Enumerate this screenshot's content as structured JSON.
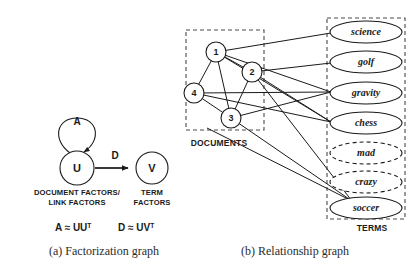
{
  "figure": {
    "background": "#ffffff",
    "stroke_color": "#1a1a1a",
    "box_color": "#4a4a4a"
  },
  "panel_a": {
    "caption": "(a) Factorization graph",
    "nodes": [
      {
        "id": "U",
        "label": "U",
        "cx": 77,
        "cy": 168,
        "r": 17
      },
      {
        "id": "V",
        "label": "V",
        "cx": 152,
        "cy": 168,
        "r": 16
      }
    ],
    "self_loop": {
      "label": "A",
      "label_x": 77,
      "label_y": 121
    },
    "edge": {
      "label": "D",
      "label_x": 115,
      "label_y": 162,
      "from": "U",
      "to": "V"
    },
    "under_labels": [
      {
        "lines": [
          "DOCUMENT FACTORS/",
          "LINK FACTORS"
        ],
        "x": 77,
        "y": 192
      },
      {
        "lines": [
          "TERM",
          "FACTORS"
        ],
        "x": 152,
        "y": 192
      }
    ],
    "formulas": [
      {
        "base": "A ≈ UU",
        "sup": "T",
        "x": 55,
        "y": 228
      },
      {
        "base": "D ≈ UV",
        "sup": "T",
        "x": 118,
        "y": 228
      }
    ]
  },
  "panel_b": {
    "caption": "(b) Relationship graph",
    "documents_group": {
      "label": "DOCUMENTS",
      "label_x": 219,
      "label_y": 143,
      "box": {
        "x": 186,
        "y": 30,
        "width": 78,
        "height": 100
      }
    },
    "terms_group": {
      "label": "TERMS",
      "label_x": 372,
      "label_y": 228,
      "box": {
        "x": 327,
        "y": 18,
        "width": 78,
        "height": 201
      }
    },
    "document_nodes": [
      {
        "id": "1",
        "label": "1",
        "cx": 216,
        "cy": 52,
        "r": 10
      },
      {
        "id": "2",
        "label": "2",
        "cx": 252,
        "cy": 72,
        "r": 10
      },
      {
        "id": "3",
        "label": "3",
        "cx": 231,
        "cy": 118,
        "r": 10
      },
      {
        "id": "4",
        "label": "4",
        "cx": 194,
        "cy": 93,
        "r": 10
      }
    ],
    "term_nodes": [
      {
        "id": "science",
        "label": "science",
        "cx": 366,
        "cy": 32,
        "rx": 36,
        "ry": 11,
        "style": "solid"
      },
      {
        "id": "golf",
        "label": "golf",
        "cx": 366,
        "cy": 62,
        "rx": 36,
        "ry": 11,
        "style": "solid"
      },
      {
        "id": "gravity",
        "label": "gravity",
        "cx": 366,
        "cy": 93,
        "rx": 36,
        "ry": 11,
        "style": "solid"
      },
      {
        "id": "chess",
        "label": "chess",
        "cx": 366,
        "cy": 123,
        "rx": 36,
        "ry": 11,
        "style": "solid"
      },
      {
        "id": "mad",
        "label": "mad",
        "cx": 366,
        "cy": 153,
        "rx": 36,
        "ry": 11,
        "style": "dashed"
      },
      {
        "id": "crazy",
        "label": "crazy",
        "cx": 366,
        "cy": 182,
        "rx": 36,
        "ry": 11,
        "style": "dashed"
      },
      {
        "id": "soccer",
        "label": "soccer",
        "cx": 366,
        "cy": 208,
        "rx": 36,
        "ry": 11,
        "style": "solid"
      }
    ],
    "document_edges": [
      {
        "from": "1",
        "to": "4"
      },
      {
        "from": "1",
        "to": "2"
      },
      {
        "from": "1",
        "to": "3"
      },
      {
        "from": "2",
        "to": "3"
      },
      {
        "from": "3",
        "to": "4"
      }
    ],
    "document_term_edges": [
      {
        "from": "1",
        "to": "science"
      },
      {
        "from": "1",
        "to": "gravity"
      },
      {
        "from": "1",
        "to": "chess"
      },
      {
        "from": "2",
        "to": "golf"
      },
      {
        "from": "2",
        "to": "chess"
      },
      {
        "from": "2",
        "to": "soccer"
      },
      {
        "from": "3",
        "to": "gravity"
      },
      {
        "from": "3",
        "to": "soccer"
      },
      {
        "from": "4",
        "to": "gravity"
      },
      {
        "from": "4",
        "to": "chess"
      },
      {
        "from": "4",
        "to": "soccer"
      }
    ]
  }
}
